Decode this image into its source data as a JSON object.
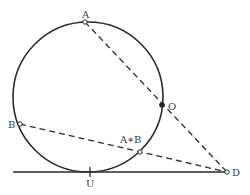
{
  "diagram": {
    "type": "geometry",
    "colors": {
      "stroke": "#2a2a2a",
      "label": "#3a3a3a",
      "background": "#ffffff"
    },
    "circle": {
      "cx": 88,
      "cy": 97,
      "r": 75
    },
    "tangent_line": {
      "x1": 13,
      "y1": 172,
      "x2": 225,
      "y2": 172
    },
    "dashed_lines": [
      {
        "from": "A",
        "to": "D"
      },
      {
        "from": "B",
        "to": "D"
      }
    ],
    "points": {
      "A": {
        "label": "A",
        "x": 85,
        "y": 22,
        "style": "hollow",
        "lx": 82,
        "ly": 18
      },
      "B": {
        "label": "B",
        "x": 20,
        "y": 124,
        "style": "hollow",
        "lx": 8,
        "ly": 128
      },
      "O": {
        "label": "O",
        "x": 162,
        "y": 105,
        "style": "filled",
        "lx": 168,
        "ly": 110
      },
      "AB": {
        "label": "A∗B",
        "x": 140,
        "y": 152,
        "style": "hollow",
        "lx": 120,
        "ly": 143
      },
      "U": {
        "label": "U",
        "x": 90,
        "y": 172,
        "style": "tick",
        "lx": 86,
        "ly": 187
      },
      "D": {
        "label": "D",
        "x": 227,
        "y": 172,
        "style": "hollow",
        "lx": 232,
        "ly": 176
      }
    }
  }
}
